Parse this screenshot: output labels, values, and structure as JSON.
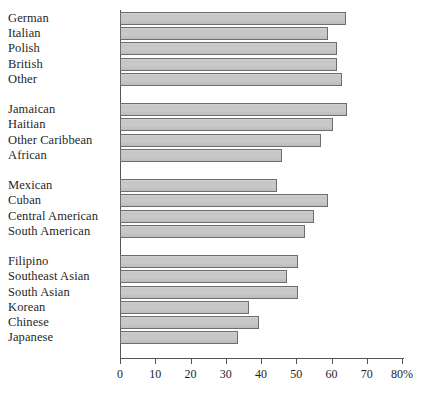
{
  "chart_data": {
    "type": "bar",
    "orientation": "horizontal",
    "title": "",
    "xlabel": "",
    "ylabel": "",
    "xlim": [
      0,
      80
    ],
    "grid": false,
    "legend": null,
    "xticks": [
      {
        "value": 0,
        "label": "0"
      },
      {
        "value": 10,
        "label": "10"
      },
      {
        "value": 20,
        "label": "20"
      },
      {
        "value": 30,
        "label": "30"
      },
      {
        "value": 40,
        "label": "40"
      },
      {
        "value": 50,
        "label": "50"
      },
      {
        "value": 60,
        "label": "60"
      },
      {
        "value": 70,
        "label": "70"
      },
      {
        "value": 80,
        "label": "80%"
      }
    ],
    "groups": [
      {
        "name": "European",
        "categories": [
          "German",
          "Italian",
          "Polish",
          "British",
          "Other"
        ],
        "values": [
          64,
          59,
          61.5,
          61.5,
          63
        ]
      },
      {
        "name": "Black/Caribbean",
        "categories": [
          "Jamaican",
          "Haitian",
          "Other Caribbean",
          "African"
        ],
        "values": [
          64.5,
          60.5,
          57,
          46
        ]
      },
      {
        "name": "Hispanic",
        "categories": [
          "Mexican",
          "Cuban",
          "Central American",
          "South American"
        ],
        "values": [
          44.5,
          59,
          55,
          52.5
        ]
      },
      {
        "name": "Asian",
        "categories": [
          "Filipino",
          "Southeast Asian",
          "South Asian",
          "Korean",
          "Chinese",
          "Japanese"
        ],
        "values": [
          50.5,
          47.5,
          50.5,
          36.5,
          39.5,
          33.5
        ]
      }
    ],
    "categories": [
      "German",
      "Italian",
      "Polish",
      "British",
      "Other",
      "Jamaican",
      "Haitian",
      "Other Caribbean",
      "African",
      "Mexican",
      "Cuban",
      "Central American",
      "South American",
      "Filipino",
      "Southeast Asian",
      "South Asian",
      "Korean",
      "Chinese",
      "Japanese"
    ],
    "values": [
      64,
      59,
      61.5,
      61.5,
      63,
      64.5,
      60.5,
      57,
      46,
      44.5,
      59,
      55,
      52.5,
      50.5,
      47.5,
      50.5,
      36.5,
      39.5,
      33.5
    ],
    "colors": {
      "bar_fill": "#c8c8c8",
      "bar_stroke": "#6d6d6d",
      "axis": "#555555",
      "text": "#1f1f1f",
      "background": "#ffffff"
    }
  }
}
